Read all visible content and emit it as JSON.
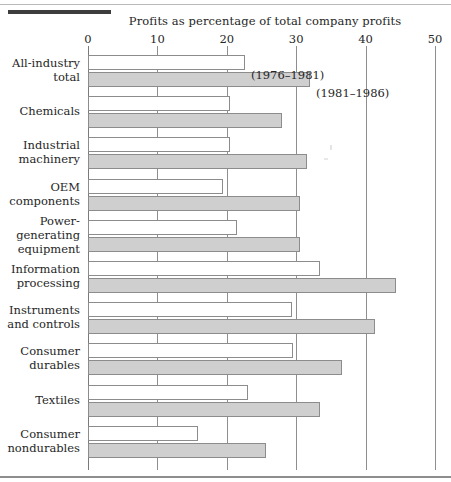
{
  "chart_data": {
    "type": "bar",
    "orientation": "horizontal",
    "title": "Profits as percentage of total company profits",
    "xlabel": "",
    "ylabel": "",
    "xlim": [
      0,
      50
    ],
    "xticks": [
      0,
      10,
      20,
      30,
      40,
      50
    ],
    "xtick_labels": [
      "0",
      "10",
      "20",
      "30",
      "40",
      "50"
    ],
    "grid": true,
    "legend_position": "inline-callout",
    "categories": [
      "All-industry total",
      "Chemicals",
      "Industrial machinery",
      "OEM components",
      "Power-generating equipment",
      "Information processing",
      "Instruments and controls",
      "Consumer durables",
      "Textiles",
      "Consumer nondurables"
    ],
    "category_lines": [
      [
        "All-industry",
        "total"
      ],
      [
        "Chemicals"
      ],
      [
        "Industrial",
        "machinery"
      ],
      [
        "OEM",
        "components"
      ],
      [
        "Power-",
        "generating",
        "equipment"
      ],
      [
        "Information",
        "processing"
      ],
      [
        "Instruments",
        "and controls"
      ],
      [
        "Consumer",
        "durables"
      ],
      [
        "Textiles"
      ],
      [
        "Consumer",
        "nondurables"
      ]
    ],
    "series": [
      {
        "name": "(1976–1981)",
        "fill": "#ffffff",
        "values": [
          22.6,
          20.4,
          20.4,
          19.5,
          21.5,
          33.5,
          29.4,
          29.6,
          23.1,
          15.8
        ]
      },
      {
        "name": "(1981–1986)",
        "fill": "#cfcfcf",
        "values": [
          32.0,
          28.0,
          31.5,
          30.5,
          30.5,
          44.4,
          41.4,
          36.6,
          33.5,
          25.7
        ]
      }
    ],
    "annotations": [
      {
        "text": "(1976–1981)",
        "series": "(1976–1981)",
        "category": "All-industry total"
      },
      {
        "text": "(1981–1986)",
        "series": "(1981–1986)",
        "category": "All-industry total"
      }
    ]
  },
  "colors": {
    "bar_period1": "#ffffff",
    "bar_period2": "#cfcfcf",
    "bar_border": "#8c8c8c",
    "gridline": "#8e8e8e",
    "text": "#262626",
    "rule": "#3d3d3d"
  }
}
